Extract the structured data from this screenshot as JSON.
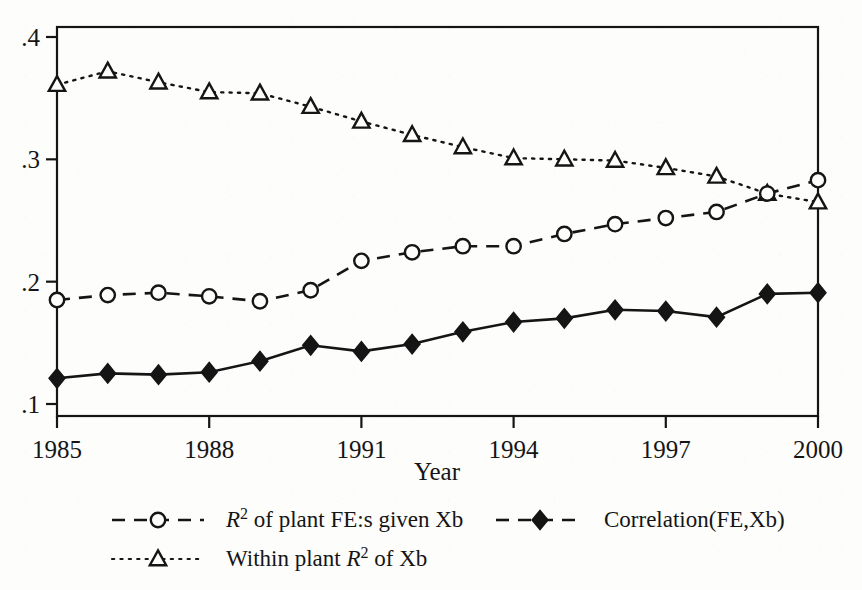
{
  "figure": {
    "background_color": "#fdfdfb",
    "ink_color": "#151515"
  },
  "axes": {
    "x_title": "Year",
    "y_title": "",
    "x_tick_labels": [
      "1985",
      "1988",
      "1991",
      "1994",
      "1997",
      "2000"
    ],
    "y_tick_labels": [
      ".1",
      ".2",
      ".3",
      ".4"
    ]
  },
  "legend": {
    "entries": [
      {
        "marker": "open-circle",
        "line": "dashed",
        "label_plain": "R2 of plant FE:s given Xb",
        "label_pre": "R",
        "label_sup": "2",
        "label_post": " of plant FE:s given Xb"
      },
      {
        "marker": "filled-diamond",
        "line": "solid-dashed",
        "label_plain": "Correlation(FE,Xb)",
        "label_pre": "",
        "label_sup": "",
        "label_post": "Correlation(FE,Xb)"
      },
      {
        "marker": "open-triangle",
        "line": "dotted",
        "label_plain": "Within plant R2 of Xb",
        "label_pre": "Within plant ",
        "label_sup": "2",
        "label_post": " of Xb",
        "label_mid": "R"
      }
    ]
  },
  "chart_data": {
    "type": "line",
    "title": "",
    "xlabel": "Year",
    "ylabel": "",
    "xlim": [
      1985,
      2000
    ],
    "ylim": [
      0.1,
      0.4
    ],
    "grid": false,
    "legend_position": "below",
    "x": [
      1985,
      1986,
      1987,
      1988,
      1989,
      1990,
      1991,
      1992,
      1993,
      1994,
      1995,
      1996,
      1997,
      1998,
      1999,
      2000
    ],
    "xticks": [
      1985,
      1988,
      1991,
      1994,
      1997,
      2000
    ],
    "yticks": [
      0.1,
      0.2,
      0.3,
      0.4
    ],
    "series": [
      {
        "name": "R2 of plant FE:s given Xb",
        "marker": "open-circle",
        "linestyle": "dashed",
        "color": "#151515",
        "values": [
          0.185,
          0.189,
          0.191,
          0.188,
          0.184,
          0.193,
          0.217,
          0.224,
          0.229,
          0.229,
          0.239,
          0.247,
          0.252,
          0.257,
          0.272,
          0.283
        ]
      },
      {
        "name": "Correlation(FE,Xb)",
        "marker": "filled-diamond",
        "linestyle": "solid",
        "color": "#151515",
        "values": [
          0.121,
          0.125,
          0.124,
          0.126,
          0.135,
          0.148,
          0.143,
          0.149,
          0.159,
          0.167,
          0.17,
          0.177,
          0.176,
          0.171,
          0.19,
          0.191
        ]
      },
      {
        "name": "Within plant R2 of Xb",
        "marker": "open-triangle",
        "linestyle": "dotted",
        "color": "#151515",
        "values": [
          0.361,
          0.372,
          0.363,
          0.355,
          0.354,
          0.343,
          0.331,
          0.32,
          0.31,
          0.301,
          0.3,
          0.299,
          0.293,
          0.286,
          0.272,
          0.265
        ]
      }
    ]
  }
}
